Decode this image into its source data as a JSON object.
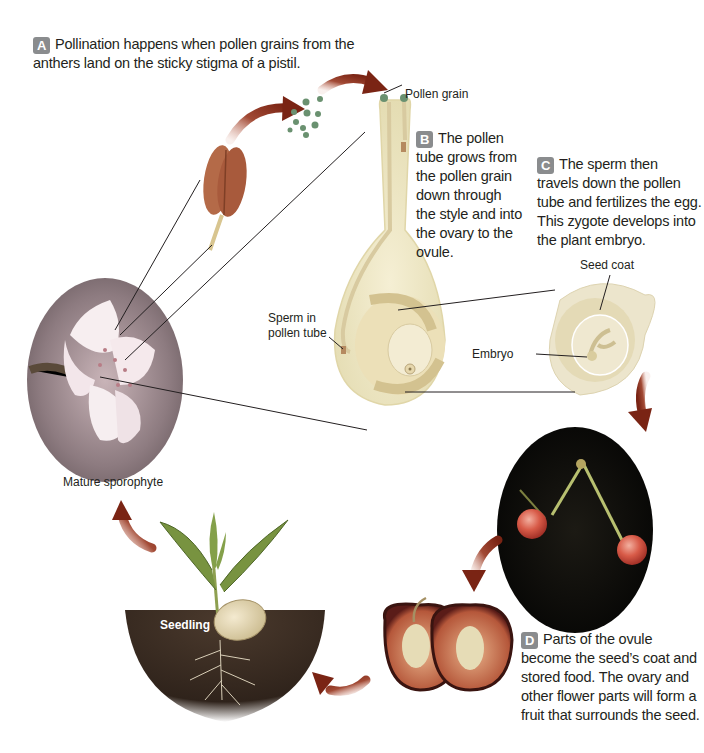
{
  "steps": {
    "A": {
      "badge": "A",
      "text_line1": "Pollination happens when pollen grains from the",
      "text_line2": "anthers land on the sticky stigma of a pistil."
    },
    "B": {
      "badge": "B",
      "lines": [
        "The pollen",
        "tube grows from",
        "the pollen grain",
        "down through",
        "the style and into",
        "the ovary to the",
        "ovule."
      ]
    },
    "C": {
      "badge": "C",
      "lines": [
        "The sperm then",
        "travels down the pollen",
        "tube and fertilizes the egg.",
        "This zygote develops into",
        "the plant embryo."
      ]
    },
    "D": {
      "badge": "D",
      "lines": [
        "Parts of the ovule",
        "become the seed’s coat and",
        "stored food. The ovary and",
        "other flower parts will form a",
        "fruit that surrounds the seed."
      ]
    }
  },
  "labels": {
    "pollen_grain": "Pollen grain",
    "sperm_in_pollen_tube_1": "Sperm in",
    "sperm_in_pollen_tube_2": "pollen tube",
    "seed_coat": "Seed coat",
    "embryo": "Embryo",
    "mature_sporophyte": "Mature sporophyte",
    "seedling": "Seedling"
  },
  "colors": {
    "arrow": "#8c2f1e",
    "badge": "#8a8c8e",
    "text": "#231f20",
    "soil": "#3a2c22",
    "leaf": "#6f8a3a",
    "cherry": "#c8463a",
    "anther": "#a85a3c",
    "pollen": "#5f8a6a"
  }
}
